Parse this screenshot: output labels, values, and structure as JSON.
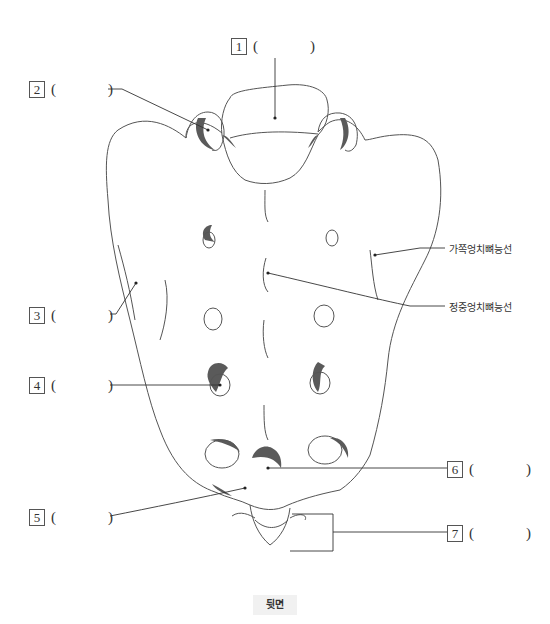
{
  "diagram": {
    "view_label": "뒷면",
    "blanks": [
      {
        "number": "1",
        "open": "(",
        "close": ")"
      },
      {
        "number": "2",
        "open": "(",
        "close": ")"
      },
      {
        "number": "3",
        "open": "(",
        "close": ")"
      },
      {
        "number": "4",
        "open": "(",
        "close": ")"
      },
      {
        "number": "5",
        "open": "(",
        "close": ")"
      },
      {
        "number": "6",
        "open": "(",
        "close": ")"
      },
      {
        "number": "7",
        "open": "(",
        "close": ")"
      }
    ],
    "annotations": {
      "lateral_crest": "가쪽엉치뼈능선",
      "median_crest": "정중엉치뼈능선"
    },
    "colors": {
      "outline": "#555555",
      "shade": "#5a5a5a",
      "leader": "#333333",
      "tag_bg": "#f1f1f1"
    }
  }
}
